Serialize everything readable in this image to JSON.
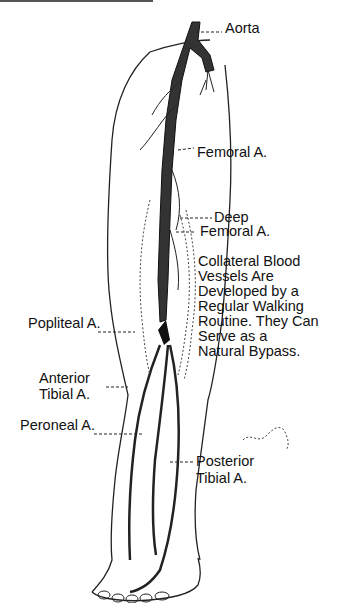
{
  "diagram": {
    "labels": {
      "aorta": "Aorta",
      "femoral": "Femoral A.",
      "deep_femoral_1": "Deep",
      "deep_femoral_2": "Femoral A.",
      "collateral": [
        "Collateral Blood",
        "Vessels Are",
        "Developed by a",
        "Regular Walking",
        "Routine. They Can",
        "Serve as a",
        "Natural Bypass."
      ],
      "popliteal": "Popliteal A.",
      "anterior_tibial_1": "Anterior",
      "anterior_tibial_2": "Tibial A.",
      "peroneal": "Peroneal A.",
      "posterior_tibial_1": "Posterior",
      "posterior_tibial_2": "Tibial A."
    }
  }
}
